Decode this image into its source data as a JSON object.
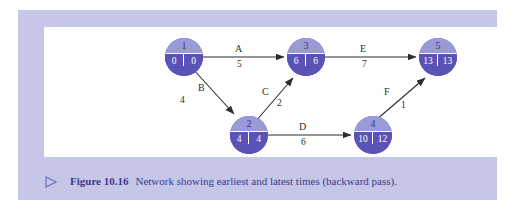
{
  "figure": {
    "marker_icon": "triangle-right-icon",
    "number_label": "Figure 10.16",
    "caption": "Network showing earliest and latest times (backward pass)."
  },
  "colors": {
    "frame": "#c5c6e8",
    "canvas": "#ffffff",
    "node_top": "#9a9ad8",
    "node_bottom": "#5a52b5",
    "node_divider": "#ffffff",
    "edge": "#2d2d2d",
    "caption_text": "#3a3a8c"
  },
  "chart_data": {
    "type": "diagram",
    "diagram_type": "activity-on-arrow network",
    "title": "Network showing earliest and latest times (backward pass)",
    "node_fields": [
      "event_number",
      "earliest_time",
      "latest_time"
    ],
    "nodes": [
      {
        "id": "1",
        "label": "1",
        "earliest": "0",
        "latest": "0",
        "x": 121,
        "y": 11
      },
      {
        "id": "2",
        "label": "2",
        "earliest": "4",
        "latest": "4",
        "x": 186,
        "y": 89
      },
      {
        "id": "3",
        "label": "3",
        "earliest": "6",
        "latest": "6",
        "x": 243,
        "y": 11
      },
      {
        "id": "4",
        "label": "4",
        "earliest": "10",
        "latest": "12",
        "x": 310,
        "y": 89
      },
      {
        "id": "5",
        "label": "5",
        "earliest": "13",
        "latest": "13",
        "x": 375,
        "y": 11
      }
    ],
    "edges": [
      {
        "activity": "A",
        "duration": "5",
        "from": "1",
        "to": "3",
        "label_x": 191,
        "label_y": 17,
        "dur_x": 193,
        "dur_y": 33
      },
      {
        "activity": "B",
        "duration": "4",
        "from": "1",
        "to": "2",
        "label_x": 154,
        "label_y": 56,
        "dur_x": 136,
        "dur_y": 69
      },
      {
        "activity": "C",
        "duration": "2",
        "from": "2",
        "to": "3",
        "label_x": 218,
        "label_y": 60,
        "dur_x": 233,
        "dur_y": 72
      },
      {
        "activity": "D",
        "duration": "6",
        "from": "2",
        "to": "4",
        "label_x": 255,
        "label_y": 95,
        "dur_x": 257,
        "dur_y": 111
      },
      {
        "activity": "E",
        "duration": "7",
        "from": "3",
        "to": "5",
        "label_x": 316,
        "label_y": 17,
        "dur_x": 318,
        "dur_y": 33
      },
      {
        "activity": "F",
        "duration": "1",
        "from": "4",
        "to": "5",
        "label_x": 340,
        "label_y": 60,
        "dur_x": 357,
        "dur_y": 74
      }
    ]
  }
}
